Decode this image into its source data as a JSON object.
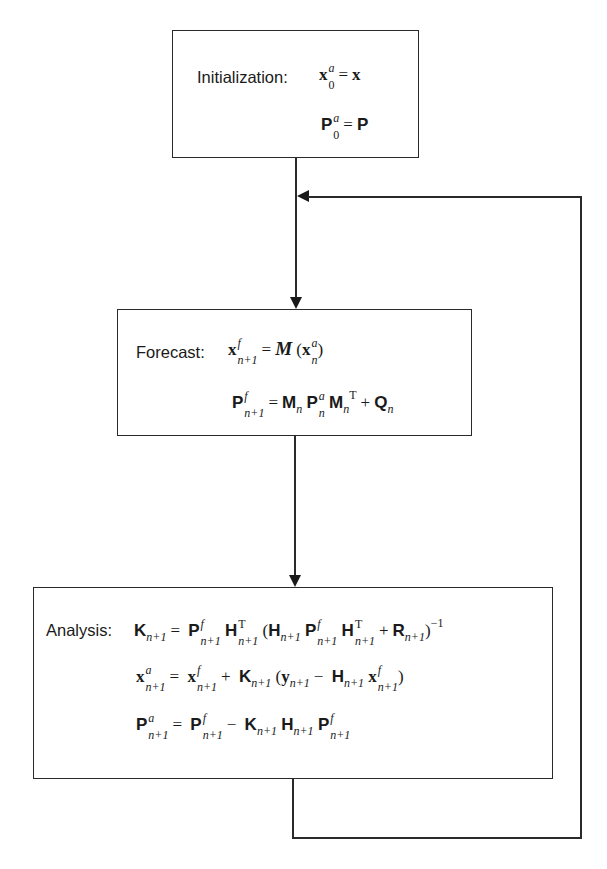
{
  "diagram": {
    "type": "flowchart",
    "colors": {
      "stroke": "#2a2a2a",
      "background": "#ffffff",
      "text": "#1a1a1a"
    },
    "nodes": [
      {
        "id": "initialization",
        "label": "Initialization:",
        "equations": [
          "x_0^a = x",
          "P_0^a = P"
        ]
      },
      {
        "id": "forecast",
        "label": "Forecast:",
        "equations": [
          "x_{n+1}^f = M(x_n^a)",
          "P_{n+1}^f = M_n P_n^a M_n^T + Q_n"
        ]
      },
      {
        "id": "analysis",
        "label": "Analysis:",
        "equations": [
          "K_{n+1} = P_{n+1}^f H_{n+1}^T (H_{n+1} P_{n+1}^f H_{n+1}^T + R_{n+1})^{-1}",
          "x_{n+1}^a = x_{n+1}^f + K_{n+1} (y_{n+1} - H_{n+1} x_{n+1}^f)",
          "P_{n+1}^a = P_{n+1}^f - K_{n+1} H_{n+1} P_{n+1}^f"
        ]
      }
    ],
    "edges": [
      {
        "from": "initialization",
        "to": "forecast"
      },
      {
        "from": "forecast",
        "to": "analysis"
      },
      {
        "from": "analysis",
        "to": "forecast",
        "note": "feedback loop"
      }
    ]
  },
  "text": {
    "init_label": "Initialization:",
    "forecast_label": "Forecast:",
    "analysis_label": "Analysis:",
    "sym": {
      "x": "x",
      "P": "P",
      "M": "M",
      "Q": "Q",
      "K": "K",
      "H": "H",
      "R": "R",
      "y": "y",
      "calM": "M",
      "eq": "=",
      "plus": "+",
      "minus": "−",
      "a": "a",
      "f": "f",
      "zero": "0",
      "n": "n",
      "n1": "n+1",
      "T": "T",
      "inv": "−1",
      "lp": "(",
      "rp": ")"
    }
  }
}
